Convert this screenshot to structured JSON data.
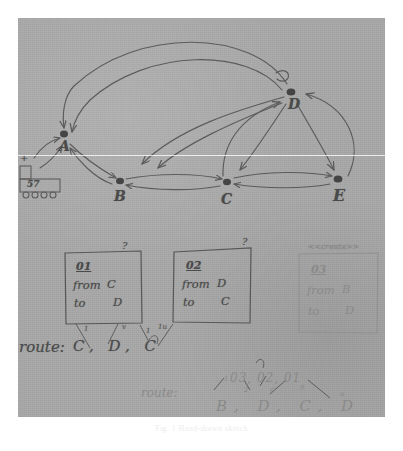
{
  "image": {
    "kind": "photograph-of-hand-drawn-sketch",
    "medium": "pencil on gray paper",
    "paper_color": "#a8a8a8",
    "ink_color": "#4a4a4a",
    "caption": "Fig. 1  Hand-drawn sketch"
  },
  "graph": {
    "nodes": [
      {
        "id": "A",
        "label": "A",
        "x": 44,
        "y": 122
      },
      {
        "id": "B",
        "label": "B",
        "x": 101,
        "y": 175
      },
      {
        "id": "C",
        "label": "C",
        "x": 208,
        "y": 176
      },
      {
        "id": "D",
        "label": "D",
        "x": 275,
        "y": 77
      },
      {
        "id": "E",
        "label": "E",
        "x": 320,
        "y": 172
      }
    ],
    "edges": [
      {
        "from": "D",
        "to": "A",
        "style": "long-arc-over-top"
      },
      {
        "from": "D",
        "to": "A",
        "style": "long-arc-over-top-2"
      },
      {
        "from": "D",
        "to": "B",
        "style": "arc"
      },
      {
        "from": "D",
        "to": "B",
        "style": "arc-2"
      },
      {
        "from": "D",
        "to": "C",
        "style": "arc"
      },
      {
        "from": "C",
        "to": "D",
        "style": "arc-back"
      },
      {
        "from": "D",
        "to": "E",
        "style": "arc"
      },
      {
        "from": "E",
        "to": "D",
        "style": "arc-back"
      },
      {
        "from": "A",
        "to": "B",
        "style": "short"
      },
      {
        "from": "B",
        "to": "A",
        "style": "short-back"
      },
      {
        "from": "B",
        "to": "C",
        "style": "straight"
      },
      {
        "from": "C",
        "to": "B",
        "style": "straight-back"
      },
      {
        "from": "C",
        "to": "E",
        "style": "straight"
      },
      {
        "from": "E",
        "to": "C",
        "style": "straight-back"
      }
    ]
  },
  "sticker": {
    "name": "train-doodle",
    "value": "57",
    "wheels": 4
  },
  "boxes": [
    {
      "id": "01",
      "id_label": "01",
      "from_label": "from",
      "from_value": "C",
      "to_label": "to",
      "to_value": "D",
      "stereotype": "",
      "x": 47,
      "y": 233,
      "w": 77,
      "h": 72
    },
    {
      "id": "02",
      "id_label": "02",
      "from_label": "from",
      "from_value": "D",
      "to_label": "to",
      "to_value": "C",
      "stereotype": "",
      "x": 155,
      "y": 232,
      "w": 78,
      "h": 73
    },
    {
      "id": "03",
      "id_label": "03",
      "from_label": "from",
      "from_value": "B",
      "to_label": "to",
      "to_value": "D",
      "stereotype": "<<create>>",
      "x": 281,
      "y": 234,
      "w": 79,
      "h": 81
    }
  ],
  "routes": [
    {
      "name": "route-nodes",
      "label": "route:",
      "value": "C, D, C",
      "tick_marks": [
        "1",
        "v",
        "1",
        "1u"
      ]
    },
    {
      "name": "route-requests",
      "label": "route:",
      "value": "03, 02, 01",
      "expanded": "B, D, C, D",
      "tick_marks": [
        "1",
        "2",
        "6",
        "9",
        "u"
      ]
    }
  ],
  "marks": {
    "question_1": "?",
    "question_2": "?",
    "plus": "+"
  }
}
